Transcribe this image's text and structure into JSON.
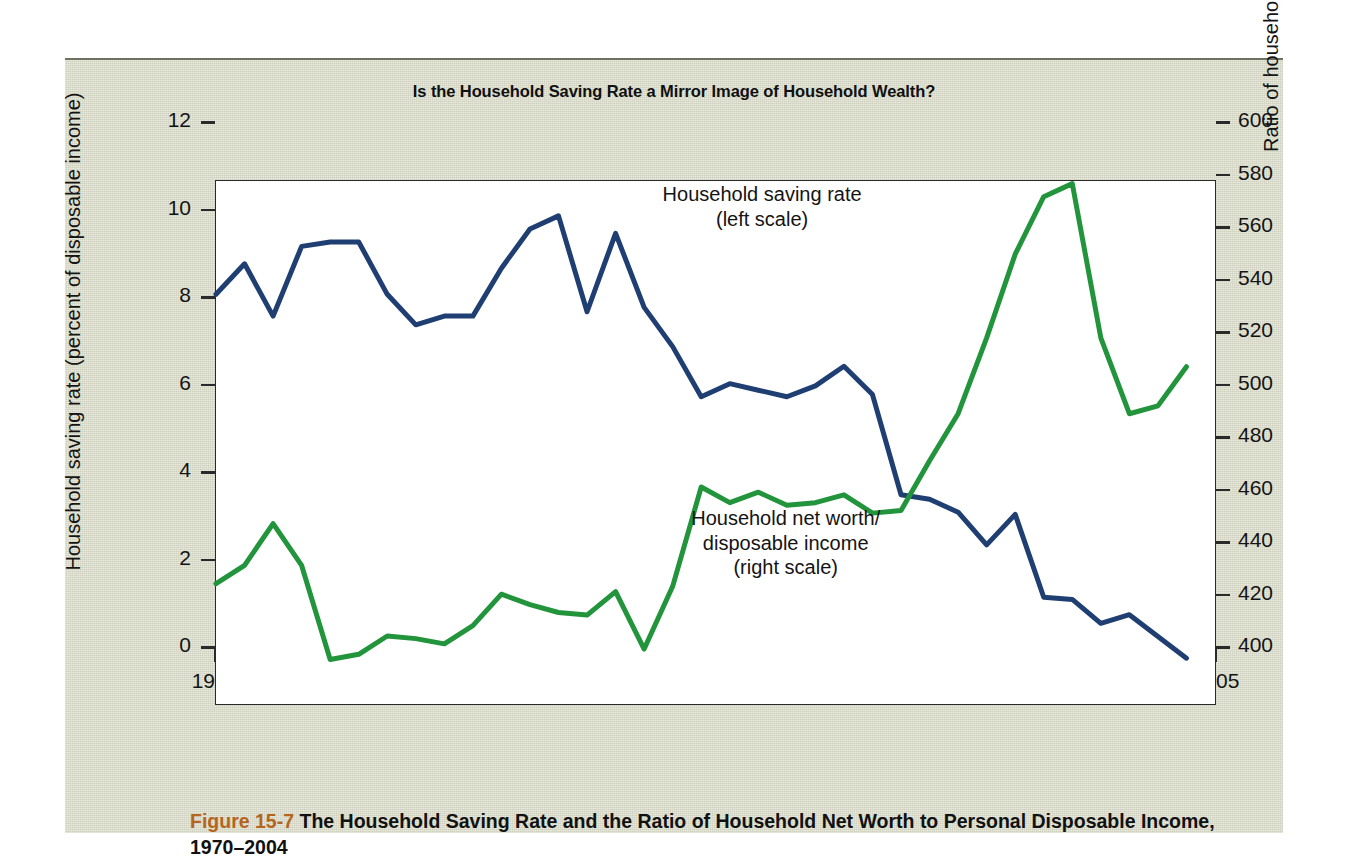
{
  "figure": {
    "title": "Is the Household Saving Rate a Mirror Image of Household Wealth?",
    "caption_number": "Figure 15-7",
    "caption_text": " The Household Saving Rate and the Ratio of Household Net Worth to Personal Disposable Income, 1970–2004",
    "number_color": "#b5651d",
    "panel_color": "#d7d9c7"
  },
  "chart_data": {
    "type": "line",
    "title": "Is the Household Saving Rate a Mirror Image of Household Wealth?",
    "xlabel": "",
    "xlim": [
      1970,
      2005
    ],
    "x_ticks_major": [
      1970,
      1975,
      1980,
      1985,
      1990,
      1995,
      2000,
      2005
    ],
    "x_tick_labels": [
      "1970",
      "1975",
      "1980",
      "1985",
      "1990",
      "1995",
      "2000",
      "2005"
    ],
    "x_minor_step": 1,
    "grid": false,
    "legend": "inline-annotations",
    "x": [
      1970,
      1971,
      1972,
      1973,
      1974,
      1975,
      1976,
      1977,
      1978,
      1979,
      1980,
      1981,
      1982,
      1983,
      1984,
      1985,
      1986,
      1987,
      1988,
      1989,
      1990,
      1991,
      1992,
      1993,
      1994,
      1995,
      1996,
      1997,
      1998,
      1999,
      2000,
      2001,
      2002,
      2003,
      2004
    ],
    "series": [
      {
        "name": "Household saving rate",
        "annotation": "Household saving rate\n(left scale)",
        "axis": "left",
        "color": "#1f3f73",
        "ylabel": "Household saving rate (percent of disposable income)",
        "ylim": [
          0,
          12
        ],
        "y_ticks": [
          0,
          2,
          4,
          6,
          8,
          10,
          12
        ],
        "y_tick_labels": [
          "0",
          "2",
          "4",
          "6",
          "8",
          "10",
          "12"
        ],
        "values": [
          9.4,
          10.1,
          8.9,
          10.5,
          10.6,
          10.6,
          9.4,
          8.7,
          8.9,
          8.9,
          10.0,
          10.9,
          11.2,
          9.0,
          10.8,
          9.1,
          8.2,
          7.05,
          7.35,
          7.2,
          7.05,
          7.3,
          7.75,
          7.1,
          4.8,
          4.7,
          4.4,
          3.65,
          4.35,
          2.45,
          2.4,
          1.85,
          2.05,
          1.55,
          1.05
        ]
      },
      {
        "name": "Household net worth/disposable income",
        "annotation": "Household net worth/\ndisposable income\n(right scale)",
        "axis": "right",
        "color": "#22943c",
        "ylabel": "Ratio of household net worth to disposable income (in percent)",
        "ylim": [
          400,
          600
        ],
        "y_ticks": [
          400,
          420,
          440,
          460,
          480,
          500,
          520,
          540,
          560,
          580,
          600
        ],
        "y_tick_labels": [
          "400",
          "420",
          "440",
          "460",
          "480",
          "500",
          "520",
          "540",
          "560",
          "580",
          "600"
        ],
        "values": [
          446,
          453,
          469,
          453,
          417,
          419,
          426,
          425,
          423,
          430,
          442,
          438,
          435,
          434,
          443,
          421,
          445,
          483,
          477,
          481,
          476,
          477,
          480,
          473,
          474,
          493,
          511,
          540,
          572,
          594,
          599,
          540,
          511,
          514,
          529
        ]
      }
    ],
    "annotations": [
      {
        "text_lines": [
          "Household saving rate",
          "(left scale)"
        ],
        "at_x": 1986,
        "at_y_left": 10.3
      },
      {
        "text_lines": [
          "Household net worth/",
          "disposable income",
          "(right scale)"
        ],
        "at_x": 1987,
        "at_y_left": 2.9
      }
    ]
  }
}
